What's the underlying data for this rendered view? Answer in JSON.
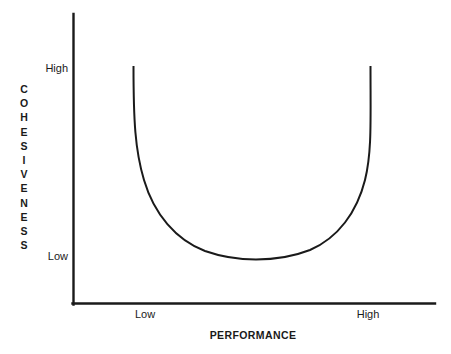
{
  "figure": {
    "background_color": "#ffffff",
    "line_color": "#1a1a1a",
    "width": 451,
    "height": 354
  },
  "axes": {
    "x": {
      "title": "PERFORMANCE",
      "ticks": [
        "Low",
        "High"
      ],
      "tick_low": "Low",
      "tick_high": "High"
    },
    "y": {
      "title": "COHESIVENESS",
      "title_chars": [
        "C",
        "O",
        "H",
        "E",
        "S",
        "I",
        "V",
        "E",
        "N",
        "E",
        "S",
        "S"
      ],
      "ticks": [
        "High",
        "Low"
      ],
      "tick_low": "Low",
      "tick_high": "High"
    }
  },
  "chart_data": {
    "type": "line",
    "title": "",
    "subtitle": "",
    "xlabel": "PERFORMANCE",
    "ylabel": "COHESIVENESS",
    "xticklabels": [
      "Low",
      "High"
    ],
    "yticklabels": [
      "Low",
      "High"
    ],
    "xlim": [
      0,
      1
    ],
    "ylim": [
      0,
      1
    ],
    "grid": false,
    "legend": false,
    "legend_position": "none",
    "annotations": [],
    "series": [
      {
        "name": "Cohesiveness vs Performance",
        "shape": "u-curve",
        "color": "#1a1a1a",
        "x": [
          0.0,
          0.0,
          0.01,
          0.03,
          0.06,
          0.11,
          0.17,
          0.24,
          0.32,
          0.41,
          0.5,
          0.59,
          0.68,
          0.76,
          0.83,
          0.89,
          0.94,
          0.97,
          0.99,
          1.0,
          1.0
        ],
        "y": [
          1.0,
          0.82,
          0.66,
          0.52,
          0.41,
          0.31,
          0.23,
          0.16,
          0.11,
          0.07,
          0.05,
          0.06,
          0.09,
          0.14,
          0.2,
          0.28,
          0.38,
          0.5,
          0.66,
          0.83,
          1.0
        ]
      }
    ]
  }
}
